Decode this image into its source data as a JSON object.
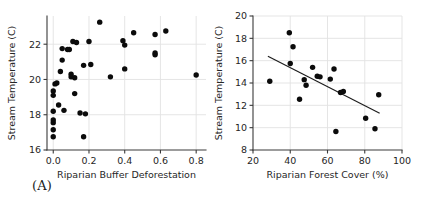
{
  "figure": {
    "background": "#ffffff",
    "point_color": "#0b0b0b",
    "line_color": "#1c1c1c",
    "grid_color": "#e2e2e2",
    "axis_color": "#3a3a3a"
  },
  "panels": [
    {
      "id": "A",
      "label": "(A)",
      "chart_data": {
        "type": "scatter",
        "title": "",
        "xlabel": "Riparian Buffer Deforestation",
        "ylabel": "Stream Temperature (C)",
        "xlim": [
          -0.035,
          0.855
        ],
        "ylim": [
          16,
          23.6
        ],
        "xticks": [
          0.0,
          0.2,
          0.4,
          0.6,
          0.8
        ],
        "xticklabels": [
          "0.0",
          "0.2",
          "0.4",
          "0.6",
          "0.8"
        ],
        "yticks": [
          16,
          18,
          20,
          22
        ],
        "yticklabels": [
          "16",
          "18",
          "20",
          "22"
        ],
        "grid": true,
        "legend": null,
        "has_fit_line": false,
        "points": [
          {
            "x": 0.0,
            "y": 16.75
          },
          {
            "x": 0.0,
            "y": 17.15
          },
          {
            "x": 0.0,
            "y": 17.55
          },
          {
            "x": 0.0,
            "y": 17.7
          },
          {
            "x": 0.0,
            "y": 18.2
          },
          {
            "x": 0.0,
            "y": 19.1
          },
          {
            "x": 0.0,
            "y": 19.35
          },
          {
            "x": 0.01,
            "y": 19.75
          },
          {
            "x": 0.02,
            "y": 19.8
          },
          {
            "x": 0.03,
            "y": 18.55
          },
          {
            "x": 0.04,
            "y": 20.45
          },
          {
            "x": 0.05,
            "y": 21.1
          },
          {
            "x": 0.05,
            "y": 21.75
          },
          {
            "x": 0.06,
            "y": 18.25
          },
          {
            "x": 0.08,
            "y": 21.7
          },
          {
            "x": 0.09,
            "y": 21.7
          },
          {
            "x": 0.1,
            "y": 20.15
          },
          {
            "x": 0.1,
            "y": 20.3
          },
          {
            "x": 0.11,
            "y": 22.15
          },
          {
            "x": 0.12,
            "y": 19.2
          },
          {
            "x": 0.12,
            "y": 20.1
          },
          {
            "x": 0.13,
            "y": 22.1
          },
          {
            "x": 0.15,
            "y": 18.1
          },
          {
            "x": 0.17,
            "y": 16.75
          },
          {
            "x": 0.17,
            "y": 20.8
          },
          {
            "x": 0.18,
            "y": 18.05
          },
          {
            "x": 0.2,
            "y": 22.15
          },
          {
            "x": 0.21,
            "y": 20.85
          },
          {
            "x": 0.26,
            "y": 23.25
          },
          {
            "x": 0.32,
            "y": 20.15
          },
          {
            "x": 0.39,
            "y": 22.2
          },
          {
            "x": 0.4,
            "y": 21.95
          },
          {
            "x": 0.4,
            "y": 20.6
          },
          {
            "x": 0.45,
            "y": 22.65
          },
          {
            "x": 0.57,
            "y": 22.55
          },
          {
            "x": 0.57,
            "y": 21.4
          },
          {
            "x": 0.57,
            "y": 21.5
          },
          {
            "x": 0.63,
            "y": 22.75
          },
          {
            "x": 0.8,
            "y": 20.25
          }
        ]
      }
    },
    {
      "id": "B",
      "label": "(B)",
      "chart_data": {
        "type": "scatter",
        "title": "",
        "xlabel": "Riparian Forest Cover (%)",
        "ylabel": "Stream Temperature (C)",
        "xlim": [
          20,
          100
        ],
        "ylim": [
          8,
          20
        ],
        "xticks": [
          20,
          40,
          60,
          80,
          100
        ],
        "xticklabels": [
          "20",
          "40",
          "60",
          "80",
          "100"
        ],
        "yticks": [
          8,
          10,
          12,
          14,
          16,
          18,
          20
        ],
        "yticklabels": [
          "8",
          "10",
          "12",
          "14",
          "16",
          "18",
          "20"
        ],
        "grid": true,
        "legend": null,
        "has_fit_line": true,
        "fit_line": {
          "x0": 28.0,
          "y0": 16.4,
          "x1": 88.0,
          "y1": 11.3
        },
        "points": [
          {
            "x": 29.0,
            "y": 14.15
          },
          {
            "x": 39.5,
            "y": 18.5
          },
          {
            "x": 41.5,
            "y": 17.25
          },
          {
            "x": 40.0,
            "y": 15.75
          },
          {
            "x": 45.0,
            "y": 12.55
          },
          {
            "x": 48.5,
            "y": 13.8
          },
          {
            "x": 47.5,
            "y": 14.3
          },
          {
            "x": 52.0,
            "y": 15.4
          },
          {
            "x": 54.5,
            "y": 14.6
          },
          {
            "x": 56.0,
            "y": 14.55
          },
          {
            "x": 61.5,
            "y": 14.35
          },
          {
            "x": 63.5,
            "y": 15.25
          },
          {
            "x": 64.5,
            "y": 9.65
          },
          {
            "x": 67.0,
            "y": 13.15
          },
          {
            "x": 68.5,
            "y": 13.25
          },
          {
            "x": 80.5,
            "y": 10.85
          },
          {
            "x": 85.5,
            "y": 9.9
          },
          {
            "x": 87.5,
            "y": 12.95
          }
        ]
      }
    }
  ]
}
